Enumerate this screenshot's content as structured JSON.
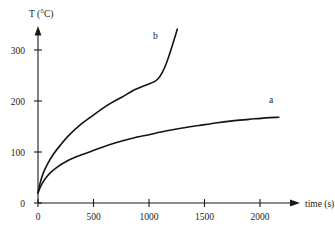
{
  "chart_data": {
    "type": "line",
    "title": "",
    "xlabel": "time (s)",
    "ylabel": "T (°C)",
    "xlim": [
      0,
      2300
    ],
    "ylim": [
      0,
      350
    ],
    "xticks": [
      0,
      500,
      1000,
      1500,
      2000
    ],
    "xtick_labels": [
      "0",
      "500",
      "1000",
      "1500",
      "2000"
    ],
    "yticks": [
      0,
      100,
      200,
      300
    ],
    "ytick_labels": [
      "0",
      "100",
      "200",
      "300"
    ],
    "grid": false,
    "legend": "inline-curve-labels",
    "series": [
      {
        "name": "a",
        "label": "a",
        "label_x": 2080,
        "label_y": 196,
        "x": [
          0,
          25,
          60,
          110,
          170,
          250,
          340,
          450,
          560,
          700,
          850,
          1000,
          1150,
          1300,
          1450,
          1600,
          1750,
          1900,
          2050,
          2170
        ],
        "y": [
          20,
          33,
          46,
          59,
          70,
          81,
          90,
          99,
          108,
          118,
          127,
          134,
          141,
          147,
          152,
          157,
          161,
          164,
          167,
          168
        ]
      },
      {
        "name": "b",
        "label": "b",
        "label_x": 1035,
        "label_y": 322,
        "x": [
          0,
          20,
          50,
          90,
          140,
          200,
          280,
          380,
          490,
          620,
          750,
          880,
          980,
          1040,
          1080,
          1120,
          1160,
          1200,
          1240,
          1255
        ],
        "y": [
          20,
          40,
          60,
          78,
          96,
          113,
          133,
          153,
          171,
          191,
          207,
          223,
          232,
          237,
          243,
          256,
          276,
          302,
          330,
          341
        ]
      }
    ]
  },
  "axes": {
    "y_axis_title": "T (°C)",
    "x_axis_title": "time (s)"
  }
}
